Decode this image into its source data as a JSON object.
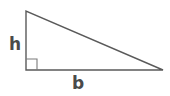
{
  "figure": {
    "kind": "right-triangle-diagram",
    "background_color": "#ffffff",
    "canvas": {
      "width": 170,
      "height": 96
    },
    "stroke_color": "#5a5a5a",
    "stroke_width": 1.4,
    "text_color": "#4a4a4a",
    "vertices": {
      "apex": {
        "x": 26,
        "y": 11
      },
      "right_angle": {
        "x": 26,
        "y": 70
      },
      "base_right": {
        "x": 163,
        "y": 70
      }
    },
    "polygon_points": "26,11 26,70 163,70",
    "right_angle_marker": {
      "name": "right-angle-square",
      "x": 26,
      "y": 59,
      "size": 11,
      "points": "37,70 37,59 26,59"
    },
    "labels": {
      "height": "h",
      "base": "b"
    }
  }
}
